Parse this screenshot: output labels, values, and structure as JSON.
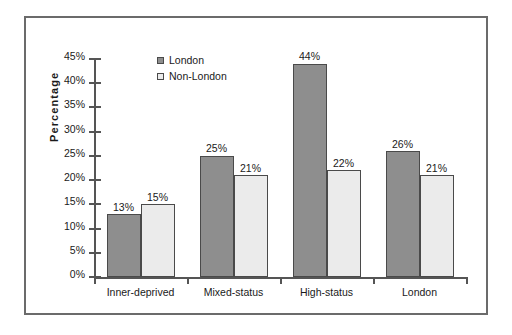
{
  "chart_data": {
    "type": "bar",
    "title": "",
    "xlabel": "",
    "ylabel": "Percentage",
    "ylim": [
      0,
      45
    ],
    "ytick_labels": [
      "0%",
      "5%",
      "10%",
      "15%",
      "20%",
      "25%",
      "30%",
      "35%",
      "40%",
      "45%"
    ],
    "ytick_values": [
      0,
      5,
      10,
      15,
      20,
      25,
      30,
      35,
      40,
      45
    ],
    "grid": false,
    "legend_position": "upper-left-inside",
    "categories": [
      "Inner-deprived",
      "Mixed-status",
      "High-status",
      "London"
    ],
    "series": [
      {
        "name": "London",
        "color": "#8e8e8e",
        "values": [
          13,
          25,
          44,
          26
        ],
        "value_labels": [
          "13%",
          "25%",
          "44%",
          "26%"
        ]
      },
      {
        "name": "Non-London",
        "color": "#ebebeb",
        "values": [
          15,
          21,
          22,
          21
        ],
        "value_labels": [
          "15%",
          "21%",
          "22%",
          "21%"
        ]
      }
    ]
  }
}
